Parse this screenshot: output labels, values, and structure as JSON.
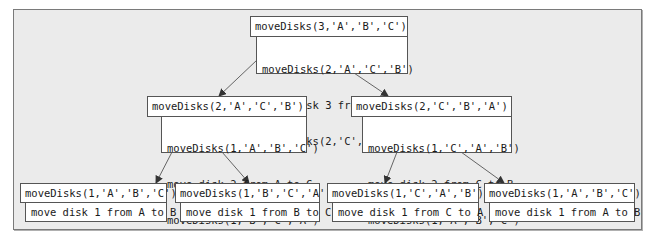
{
  "diagram": {
    "type": "recursion-tree",
    "colors": {
      "background": "#ebebeb",
      "box": "#ffffff",
      "border": "#555555",
      "arrow": "#444444"
    },
    "root": {
      "call": "moveDisks(3,'A','B','C')",
      "body": [
        "moveDisks(2,'A','C','B')",
        "move disk 3 from A to B",
        "moveDisks(2,'C','B','A')"
      ]
    },
    "level2": [
      {
        "call": "moveDisks(2,'A','C','B')",
        "body": [
          "moveDisks(1,'A','B','C')",
          "move disk 2 from A to C",
          "moveDisks(1,'B','C','A')"
        ]
      },
      {
        "call": "moveDisks(2,'C','B','A')",
        "body": [
          "moveDisks(1,'C','A','B')",
          "move disk 2 from C to B",
          "moveDisks(1,'A','B','C')"
        ]
      }
    ],
    "leaves": [
      {
        "call": "moveDisks(1,'A','B','C')",
        "body": "move disk 1 from A to B"
      },
      {
        "call": "moveDisks(1,'B','C','A')",
        "body": "move disk 1 from B to C"
      },
      {
        "call": "moveDisks(1,'C','A','B')",
        "body": "move disk 1 from C to A"
      },
      {
        "call": "moveDisks(1,'A','B','C')",
        "body": "move disk 1 from A to B"
      }
    ]
  }
}
